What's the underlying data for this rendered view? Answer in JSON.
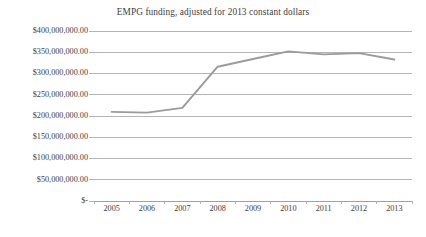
{
  "chart_data": {
    "type": "line",
    "title": "EMPG funding, adjusted for 2013 constant dollars",
    "xlabel": "",
    "ylabel": "",
    "categories": [
      "2005",
      "2006",
      "2007",
      "2008",
      "2009",
      "2010",
      "2011",
      "2012",
      "2013"
    ],
    "values": [
      209800000,
      208000000,
      219000000,
      316000000,
      334000000,
      352000000,
      345000000,
      348000000,
      333000000
    ],
    "series": [
      {
        "name": "EMPG funding",
        "values": [
          209800000,
          208000000,
          219000000,
          316000000,
          334000000,
          352000000,
          345000000,
          348000000,
          333000000
        ]
      }
    ],
    "ylim": [
      0,
      400000000
    ],
    "ytick_values": [
      0,
      50000000,
      100000000,
      150000000,
      200000000,
      250000000,
      300000000,
      350000000,
      400000000
    ],
    "ytick_labels": [
      "$-",
      "$50,000,000.00",
      "$100,000,000.00",
      "$150,000,000.00",
      "$200,000,000.00",
      "$250,000,000.00",
      "$300,000,000.00",
      "$350,000,000.00",
      "$400,000,000.00"
    ],
    "grid": true,
    "legend": false,
    "legend_position": "none",
    "line_color": "#9b9b9b",
    "grid_color": "#a8a8a8",
    "text_color": "#3d3d3d",
    "background": "#ffffff"
  }
}
